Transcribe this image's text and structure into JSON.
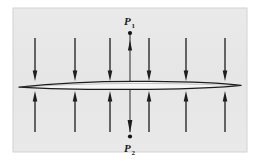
{
  "figure": {
    "kind": "pressure-distribution-airfoil-diagram",
    "panel": {
      "background_color": "#e8e8e8",
      "border_color": "#cfcfcf",
      "x": 13,
      "y": 8,
      "width": 234,
      "height": 144
    },
    "page_background_color": "#ffffff",
    "ink_color": "#1d1d1d"
  },
  "labels": {
    "top_point": {
      "symbol": "P",
      "subscript": "1",
      "full_text": "P1",
      "x": 124,
      "y": 24
    },
    "bottom_point": {
      "symbol": "P",
      "subscript": "2",
      "full_text": "P2",
      "x": 124,
      "y": 152
    }
  },
  "airfoil": {
    "name": "thin-airfoil-section",
    "left_tip_x": 19,
    "right_tip_x": 241,
    "center_y": 86,
    "max_thickness": 5,
    "outline_color": "#1d1d1d",
    "fill_color": "#f4f4f4"
  },
  "center_axis": {
    "name": "vertical-pressure-axis",
    "x": 130,
    "top_y": 32,
    "bottom_y": 133,
    "top_arrow_direction": "up",
    "bottom_arrow_direction": "down",
    "endpoint_dot_radius": 2.1,
    "line_color": "#2a2a2a"
  },
  "arrows": {
    "above": {
      "name": "downward-pressure-arrows",
      "direction": "down",
      "count": 6,
      "tail_y": 38,
      "head_y": 80,
      "x_positions": [
        35,
        75,
        110,
        149,
        186,
        225
      ]
    },
    "below": {
      "name": "upward-pressure-arrows",
      "direction": "up",
      "count": 6,
      "tail_y": 132,
      "head_y": 92,
      "x_positions": [
        35,
        75,
        110,
        149,
        186,
        225
      ]
    },
    "shaft_width": 1.4,
    "head_width": 4.6,
    "head_length": 10,
    "color": "#1d1d1d"
  }
}
